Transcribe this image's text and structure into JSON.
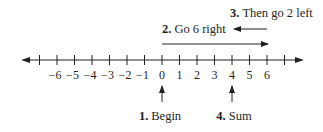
{
  "diagram": {
    "type": "number-line",
    "colors": {
      "ink": "#231f20",
      "background": "#ffffff"
    },
    "axis": {
      "min_tick": -7,
      "max_tick": 7,
      "labeled_ticks": [
        -6,
        -5,
        -4,
        -3,
        -2,
        -1,
        0,
        1,
        2,
        3,
        4,
        5,
        6
      ],
      "tick_labels": [
        "−6",
        "−5",
        "−4",
        "−3",
        "−2",
        "−1",
        "0",
        "1",
        "2",
        "3",
        "4",
        "5",
        "6"
      ],
      "arrows_both_ends": true
    },
    "steps": [
      {
        "number": "1.",
        "text": "Begin",
        "position": 0
      },
      {
        "number": "2.",
        "text": "Go 6 right",
        "from": 0,
        "to": 6
      },
      {
        "number": "3.",
        "text": "Then go 2 left",
        "from": 6,
        "to": 4
      },
      {
        "number": "4.",
        "text": "Sum",
        "position": 4
      }
    ]
  }
}
